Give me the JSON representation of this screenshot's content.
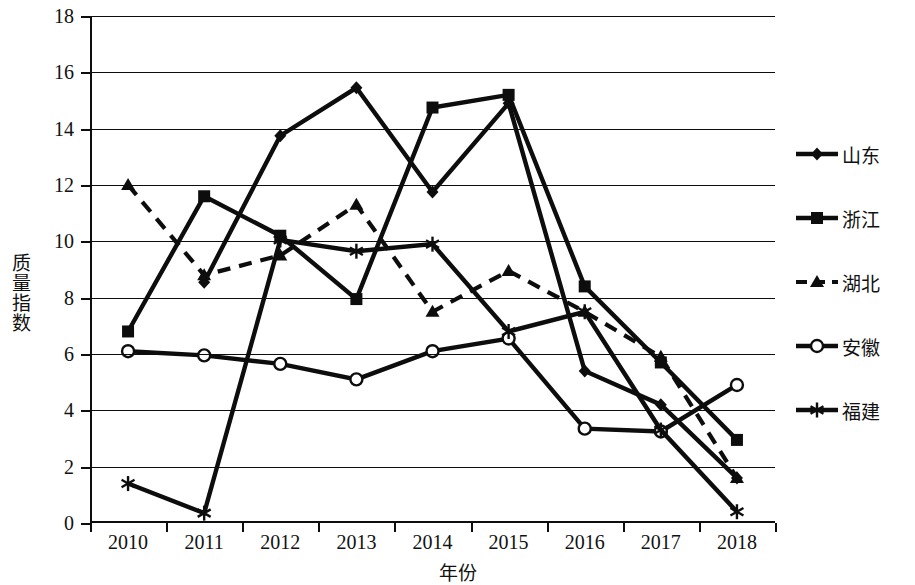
{
  "chart_data": {
    "type": "line",
    "title": "",
    "xlabel": "年份",
    "ylabel": "质量指数",
    "categories": [
      "2010",
      "2011",
      "2012",
      "2013",
      "2014",
      "2015",
      "2016",
      "2017",
      "2018"
    ],
    "x": [
      2010,
      2011,
      2012,
      2013,
      2014,
      2015,
      2016,
      2017,
      2018
    ],
    "ylim": [
      0,
      18
    ],
    "ytick_values": [
      0,
      2,
      4,
      6,
      8,
      10,
      12,
      14,
      16,
      18
    ],
    "ytick_labels": [
      "0",
      "2",
      "4",
      "6",
      "8",
      "10",
      "12",
      "14",
      "16",
      "18"
    ],
    "grid": "horizontal",
    "legend_position": "right",
    "series": [
      {
        "name": "山东",
        "marker": "diamond",
        "line": "solid",
        "values": [
          null,
          8.55,
          13.75,
          15.45,
          11.75,
          14.9,
          5.4,
          4.2,
          1.6
        ]
      },
      {
        "name": "浙江",
        "marker": "square",
        "line": "solid",
        "values": [
          6.8,
          11.6,
          10.2,
          7.95,
          14.75,
          15.2,
          8.4,
          5.7,
          2.95
        ]
      },
      {
        "name": "湖北",
        "marker": "triangle",
        "line": "dashed",
        "values": [
          12.0,
          8.8,
          9.5,
          11.3,
          7.5,
          8.95,
          7.5,
          5.9,
          1.6
        ]
      },
      {
        "name": "安徽",
        "marker": "circle-open",
        "line": "solid",
        "values": [
          6.1,
          5.95,
          5.65,
          5.1,
          6.1,
          6.55,
          3.35,
          3.25,
          4.9
        ]
      },
      {
        "name": "福建",
        "marker": "asterisk",
        "line": "solid",
        "values": [
          1.4,
          0.35,
          10.05,
          9.65,
          9.9,
          6.8,
          7.5,
          3.3,
          0.4
        ]
      }
    ]
  },
  "legend": {
    "items": [
      {
        "label": "山东"
      },
      {
        "label": "浙江"
      },
      {
        "label": "湖北"
      },
      {
        "label": "安徽"
      },
      {
        "label": "福建"
      }
    ]
  },
  "colors": {
    "ink": "#0d0d0d",
    "background": "#ffffff"
  }
}
